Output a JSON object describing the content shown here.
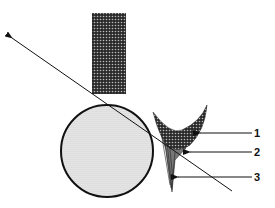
{
  "diagram": {
    "labels": [
      {
        "id": "1",
        "text": "1"
      },
      {
        "id": "2",
        "text": "2"
      },
      {
        "id": "3",
        "text": "3"
      }
    ],
    "colors": {
      "ink": "#111111",
      "background": "#ffffff",
      "light_fill": "#d9d9d9",
      "dark_fill": "#3a3a3a"
    }
  }
}
